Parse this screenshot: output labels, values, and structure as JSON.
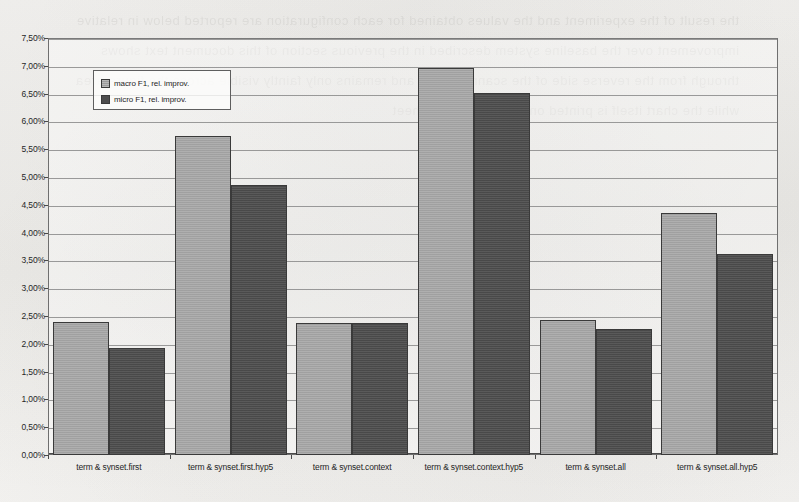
{
  "chart_data": {
    "type": "bar",
    "title": "",
    "subtitle": "",
    "xlabel": "",
    "ylabel": "",
    "ylim": [
      0,
      7.5
    ],
    "ytick_step": 0.5,
    "grid": true,
    "decimal_separator": ",",
    "value_suffix": "%",
    "legend_position": "upper-left-inside",
    "categories": [
      "term & synset.first",
      "term & synset.first.hyp5",
      "term & synset.context",
      "term & synset.context.hyp5",
      "term & synset.all",
      "term & synset.all.hyp5"
    ],
    "ytick_labels": [
      "0,00%",
      "0,50%",
      "1,00%",
      "1,50%",
      "2,00%",
      "2,50%",
      "3,00%",
      "3,50%",
      "4,00%",
      "4,50%",
      "5,00%",
      "5,50%",
      "6,00%",
      "6,50%",
      "7,00%",
      "7,50%"
    ],
    "ytick_values": [
      0,
      0.5,
      1,
      1.5,
      2,
      2.5,
      3,
      3.5,
      4,
      4.5,
      5,
      5.5,
      6,
      6.5,
      7,
      7.5
    ],
    "series": [
      {
        "name": "macro F1, rel. improv.",
        "color": "#a6a6a6",
        "values": [
          2.4,
          5.73,
          2.38,
          6.96,
          2.43,
          4.36
        ]
      },
      {
        "name": "micro F1, rel. improv.",
        "color": "#4d4d4d",
        "values": [
          1.93,
          4.85,
          2.38,
          6.52,
          2.27,
          3.62
        ]
      }
    ]
  },
  "legend": {
    "entries": [
      {
        "label": "macro F1, rel. improv."
      },
      {
        "label": "micro F1, rel. improv."
      }
    ]
  },
  "page": {
    "bleed_text": "the result of the experiment and the values obtained for each configuration are reported below in relative improvement over the baseline system described in the previous section of this document text shows through from the reverse side of the scanned page and remains only faintly visible across the figure area while the chart itself is printed on this side of the sheet"
  }
}
